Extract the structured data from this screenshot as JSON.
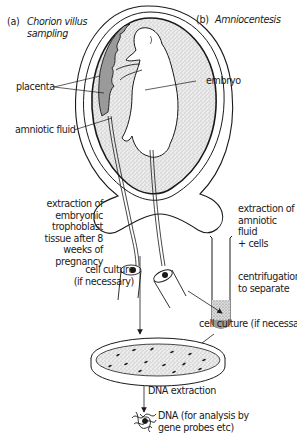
{
  "panels": {
    "a": {
      "letter": "(a)",
      "title": "Chorion villus\nsampling"
    },
    "b": {
      "letter": "(b)",
      "title": "Amniocentesis"
    }
  },
  "labels": {
    "placenta": "placenta",
    "embryo": "embryo",
    "amniotic_fluid": "amniotic fluid",
    "cvs_extraction": "extraction of\nembryonic\ntrophoblast\ntissue after 8\nweeks of\npregnancy",
    "amnio_extraction": "extraction of\namniotic fluid\n+ cells",
    "centrifugation": "centrifugation\nto separate",
    "cell_culture_left": "cell culture\n(if necessary)",
    "cell_culture_right": "cell culture (if necessary)",
    "dna_extraction": "DNA extraction",
    "dna_result": "DNA (for analysis by\ngene probes etc)"
  },
  "colors": {
    "ink": "#1a1a1a",
    "stipple": "#c9c9c9",
    "placenta": "#9a9a9a",
    "background": "#ffffff"
  }
}
